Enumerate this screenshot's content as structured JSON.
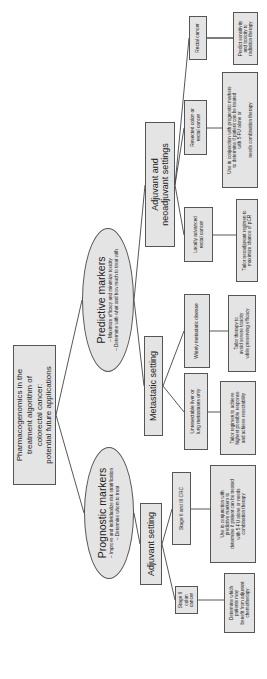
{
  "diagram": {
    "root": {
      "label": "Pharmacogenomics in the\ntreatment algorithm of\ncolorectal cancer:\npotential future applications"
    },
    "predictive": {
      "title": "Predictive markers",
      "sub1": "– Maximize efficacy and minimize toxicity",
      "sub2": "– Determine with what and how much to treat with"
    },
    "prognostic": {
      "title": "Prognostic markers",
      "sub1": "– Improve and individualize risk stratification",
      "sub2": "– Determine whom to treat"
    },
    "settings": {
      "adjuvant_neoadjuvant": "Adjuvant and\nneoadjuvant settings",
      "metastatic": "Metastatic setting",
      "adjuvant": "Adjuvant setting"
    },
    "conditions": {
      "rectal": "Rectal cancer",
      "resected": "Resected colon or\nrectal cancer",
      "locally_advanced": "Locally advanced\nrectal cancer",
      "widely_metastatic": "Widely metastatic disease",
      "unresectable": "Unresectable liver or\nlung metastases only",
      "stage_2_3": "Stage II and III CRC",
      "stage_2_colon": "Stage II\ncolon\ncancer"
    },
    "outcomes": {
      "predict_sensitivity": "Predict sensitivity\nand toxicity to\nradiation therapy",
      "use_with_prognostic": "Use in conjunction with prognostic markers\nto determine if patient can be treated\nwith 5-FU alone or\n\nneeds combination therapy",
      "tailor_neoadjuvant": "Tailor neoadjuvant regimen to\nmaximize chance of pCR",
      "tailor_therapy": "Tailor therapy to\navoid severe toxicity\nwhile preserving efficacy",
      "tailor_regimen": "Tailor regimen to achieve\nhighest possible response\nand achieve resectability",
      "use_with_predictive": "Use in conjunction with\npredictive markers to\ndetermine if patient can be treated\nwith 5-FU alone or needs\ncombination therapy",
      "determine_which": "Determine which\npatients may\nbenefit from adjuvant\nchemotherapy"
    },
    "colors": {
      "node_fill": "#e4e4e4",
      "node_border": "#555555",
      "line": "#444444"
    }
  }
}
